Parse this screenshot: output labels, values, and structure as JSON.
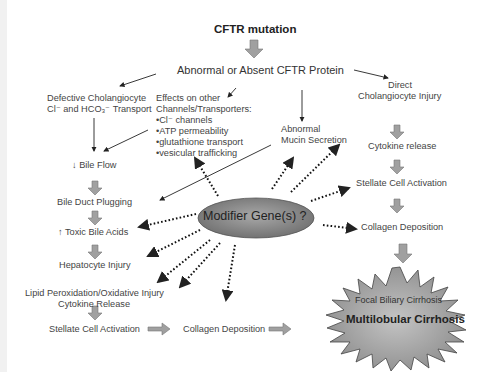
{
  "diagram": {
    "title": "CFTR mutation",
    "protein": "Abnormal or Absent CFTR Protein",
    "left_branch": {
      "defective_transport_line1": "Defective Cholangiocyte",
      "defective_transport_line2": "Cl⁻ and HCO₃⁻ Transport",
      "bile_flow": "↓ Bile Flow",
      "bile_duct_plugging": "Bile Duct Plugging",
      "toxic_bile_acids": "↑ Toxic Bile Acids",
      "hepatocyte_injury": "Hepatocyte Injury",
      "lipid_peroxidation": "Lipid Peroxidation/Oxidative Injury",
      "cytokine_release": "Cytokine Release",
      "stellate_activation": "Stellate Cell Activation",
      "collagen_deposition": "Collagen Deposition"
    },
    "effects": {
      "heading_line1": "Effects on other",
      "heading_line2": "Channels/Transporters:",
      "items": [
        "•Cl⁻ channels",
        "•ATP permeability",
        "•glutathione transport",
        "•vesicular trafficking"
      ]
    },
    "mucin": {
      "line1": "Abnormal",
      "line2": "Mucin Secretion"
    },
    "right_branch": {
      "direct_line1": "Direct",
      "direct_line2": "Cholangiocyte Injury",
      "cytokine_release": "Cytokine release",
      "stellate_activation": "Stellate Cell Activation",
      "collagen_deposition": "Collagen Deposition"
    },
    "modifier": "Modifier Gene(s) ?",
    "outcome": {
      "focal": "Focal Biliary Cirrhosis",
      "multilobular": "Multilobular Cirrhosis"
    },
    "colors": {
      "text": "#444444",
      "arrow_fill": "#9a9a9a",
      "ellipse": "#8a8a8a",
      "starburst": "#a8a8a8"
    }
  }
}
